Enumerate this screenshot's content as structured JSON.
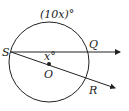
{
  "diagram": {
    "type": "geometry-circle",
    "circle": {
      "center_label": "O"
    },
    "points": {
      "S": "S",
      "Q": "Q",
      "R": "R",
      "O": "O"
    },
    "arc_label": "(10x)°",
    "angle_label": "x°",
    "colors": {
      "stroke": "#222222",
      "background": "#ffffff"
    }
  }
}
